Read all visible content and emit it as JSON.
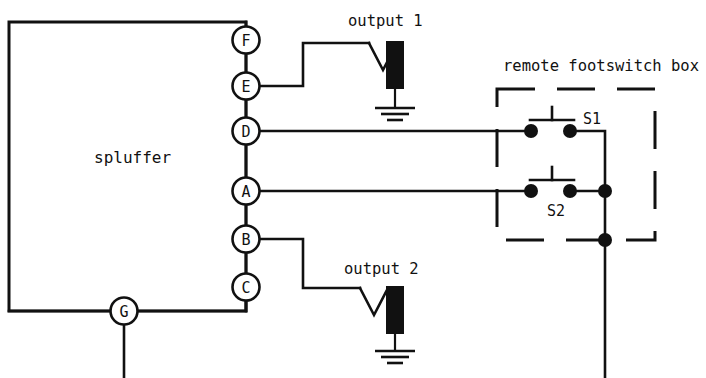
{
  "diagram": {
    "device": {
      "name": "spluffer",
      "label": "spluffer",
      "terminals": [
        {
          "id": "F",
          "label": "F",
          "x": 246,
          "y": 40
        },
        {
          "id": "E",
          "label": "E",
          "x": 246,
          "y": 86
        },
        {
          "id": "D",
          "label": "D",
          "x": 246,
          "y": 131
        },
        {
          "id": "A",
          "label": "A",
          "x": 246,
          "y": 191
        },
        {
          "id": "B",
          "label": "B",
          "x": 246,
          "y": 239
        },
        {
          "id": "C",
          "label": "C",
          "x": 246,
          "y": 287
        },
        {
          "id": "G",
          "label": "G",
          "x": 124,
          "y": 311
        }
      ]
    },
    "outputs": [
      {
        "id": "output-1",
        "label": "output 1",
        "label_x": 348,
        "label_y": 26,
        "connector": "coax-bnc-with-ground"
      },
      {
        "id": "output-2",
        "label": "output 2",
        "label_x": 344,
        "label_y": 274,
        "connector": "coax-bnc-with-ground"
      }
    ],
    "footswitch_box": {
      "label": "remote footswitch box",
      "label_x": 503,
      "label_y": 71,
      "border_style": "dashed",
      "switches": [
        {
          "id": "S1",
          "label": "S1",
          "label_x": 583,
          "label_y": 124,
          "type": "momentary-pushbutton-normally-open"
        },
        {
          "id": "S2",
          "label": "S2",
          "label_x": 547,
          "label_y": 216,
          "type": "momentary-pushbutton-normally-open"
        }
      ]
    },
    "colors": {
      "line": "#111111",
      "background": "#ffffff",
      "node_fill": "#111111",
      "terminal_fill": "#ffffff"
    }
  }
}
